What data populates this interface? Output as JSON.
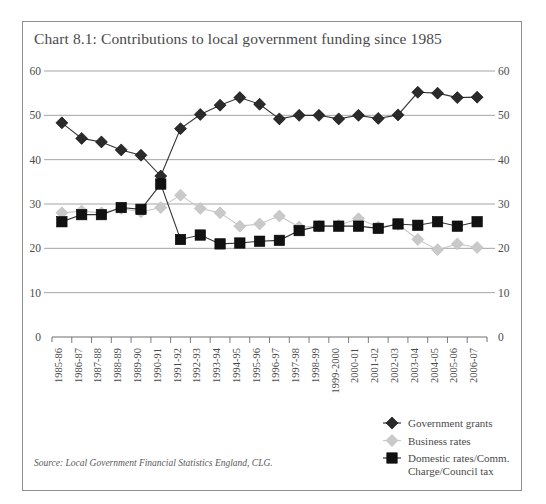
{
  "title": "Chart 8.1: Contributions to local government funding since 1985",
  "source": "Source: Local Government Financial Statistics England, CLG.",
  "colors": {
    "government_grants": "#2b2b2b",
    "business_rates": "#c9c9c9",
    "domestic_rates": "#111111",
    "gridline": "#9b9b9b",
    "axis": "#6e6e6e",
    "text": "#4a4a4a",
    "border": "#8f8f8f",
    "background": "#ffffff"
  },
  "legend": {
    "position": "bottom-right",
    "items": [
      {
        "label": "Government grants",
        "marker": "diamond",
        "color": "#2b2b2b"
      },
      {
        "label": "Business rates",
        "marker": "diamond",
        "color": "#c9c9c9"
      },
      {
        "label": "Domestic rates/Comm. Charge/Council tax",
        "marker": "square",
        "color": "#111111",
        "label_line1": "Domestic rates/Comm.",
        "label_line2": "Charge/Council tax"
      }
    ]
  },
  "chart_data": {
    "type": "line",
    "title": "Chart 8.1: Contributions to local government funding since 1985",
    "xlabel": "",
    "ylabel": "",
    "ylim": [
      0,
      60
    ],
    "yticks": [
      0,
      10,
      20,
      30,
      40,
      50,
      60
    ],
    "grid": true,
    "dual_y_axis": true,
    "legend_position": "bottom-right",
    "categories": [
      "1985-86",
      "1986-87",
      "1987-88",
      "1988-89",
      "1989-90",
      "1990-91",
      "1991-92",
      "1992-93",
      "1993-94",
      "1994-95",
      "1995-96",
      "1996-97",
      "1997-98",
      "1998-99",
      "1999-2000",
      "2000-01",
      "2001-02",
      "2002-03",
      "2003-04",
      "2004-05",
      "2005-06",
      "2006-07"
    ],
    "series": [
      {
        "name": "Government grants",
        "marker": "diamond",
        "color": "#2b2b2b",
        "values": [
          48.3,
          44.8,
          44.0,
          42.2,
          41.0,
          36.3,
          47.0,
          50.2,
          52.3,
          54.0,
          52.5,
          49.2,
          50.0,
          50.0,
          49.2,
          50.0,
          49.3,
          50.1,
          55.2,
          55.0,
          54.0,
          54.1
        ]
      },
      {
        "name": "Business rates",
        "marker": "diamond",
        "color": "#c9c9c9",
        "values": [
          28.0,
          28.4,
          28.0,
          29.0,
          28.2,
          29.2,
          32.0,
          29.0,
          28.0,
          25.0,
          25.5,
          27.3,
          24.8,
          25.0,
          25.2,
          26.7,
          24.8,
          25.4,
          22.0,
          19.7,
          21.0,
          20.2
        ]
      },
      {
        "name": "Domestic rates/Comm. Charge/Council tax",
        "marker": "square",
        "color": "#111111",
        "values": [
          26.0,
          27.6,
          27.6,
          29.2,
          28.8,
          34.5,
          22.0,
          23.0,
          21.0,
          21.2,
          21.6,
          21.8,
          24.0,
          25.0,
          25.0,
          25.0,
          24.5,
          25.5,
          25.2,
          26.0,
          25.0,
          26.0
        ]
      }
    ]
  }
}
